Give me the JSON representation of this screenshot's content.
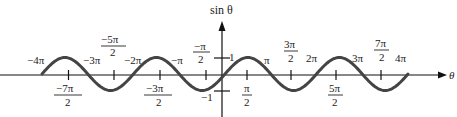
{
  "chart_data": {
    "type": "line",
    "title": "",
    "xlabel": "θ",
    "ylabel": "sin θ",
    "function": "sin(θ)",
    "xlim": [
      "-4π",
      "4π"
    ],
    "ylim": [
      -1,
      1
    ],
    "grid": false,
    "legend": null,
    "x_values_in_pi": [
      -4,
      -3.5,
      -3,
      -2.5,
      -2,
      -1.5,
      -1,
      -0.5,
      0,
      0.5,
      1,
      1.5,
      2,
      2.5,
      3,
      3.5,
      4
    ],
    "y_values": [
      0,
      1,
      0,
      -1,
      0,
      1,
      0,
      -1,
      0,
      1,
      0,
      -1,
      0,
      1,
      0,
      -1,
      0
    ],
    "x_tick_labels_above": [
      {
        "pos_pi": -4,
        "text": "−4π"
      },
      {
        "pos_pi": -3,
        "text": "−3π"
      },
      {
        "pos_pi": -2.5,
        "num": "−5π",
        "den": "2"
      },
      {
        "pos_pi": -2,
        "text": "−2π"
      },
      {
        "pos_pi": -1,
        "text": "−π"
      },
      {
        "pos_pi": -0.5,
        "num": "−π",
        "den": "2"
      },
      {
        "pos_pi": 1,
        "text": "π"
      },
      {
        "pos_pi": 1.5,
        "num": "3π",
        "den": "2"
      },
      {
        "pos_pi": 2,
        "text": "2π"
      },
      {
        "pos_pi": 3,
        "text": "3π"
      },
      {
        "pos_pi": 3.5,
        "num": "7π",
        "den": "2"
      },
      {
        "pos_pi": 4,
        "text": "4π"
      }
    ],
    "x_tick_labels_below": [
      {
        "pos_pi": -3.5,
        "num": "−7π",
        "den": "2"
      },
      {
        "pos_pi": -1.5,
        "num": "−3π",
        "den": "2"
      },
      {
        "pos_pi": 0.5,
        "num": "π",
        "den": "2"
      },
      {
        "pos_pi": 2.5,
        "num": "5π",
        "den": "2"
      }
    ],
    "y_tick_labels": [
      {
        "value": 1,
        "text": "1"
      },
      {
        "value": -1,
        "text": "−1"
      }
    ]
  },
  "labels": {
    "y_axis": "sin θ",
    "x_axis": "θ",
    "y_pos": "1",
    "y_neg": "−1",
    "neg4pi": "−4π",
    "neg3pi": "−3π",
    "neg5pi_num": "−5π",
    "neg5pi_den": "2",
    "neg2pi": "−2π",
    "negpi": "−π",
    "negpi2_num": "−π",
    "negpi2_den": "2",
    "pi": "π",
    "pi3_2_num": "3π",
    "pi3_2_den": "2",
    "twopi": "2π",
    "threepi": "3π",
    "pi7_2_num": "7π",
    "pi7_2_den": "2",
    "fourpi": "4π",
    "neg7pi2_num": "−7π",
    "neg7pi2_den": "2",
    "neg3pi2_num": "−3π",
    "neg3pi2_den": "2",
    "pi2_num": "π",
    "pi2_den": "2",
    "pi5_2_num": "5π",
    "pi5_2_den": "2"
  },
  "colors": {
    "curve": "#444444",
    "axis": "#111111"
  }
}
